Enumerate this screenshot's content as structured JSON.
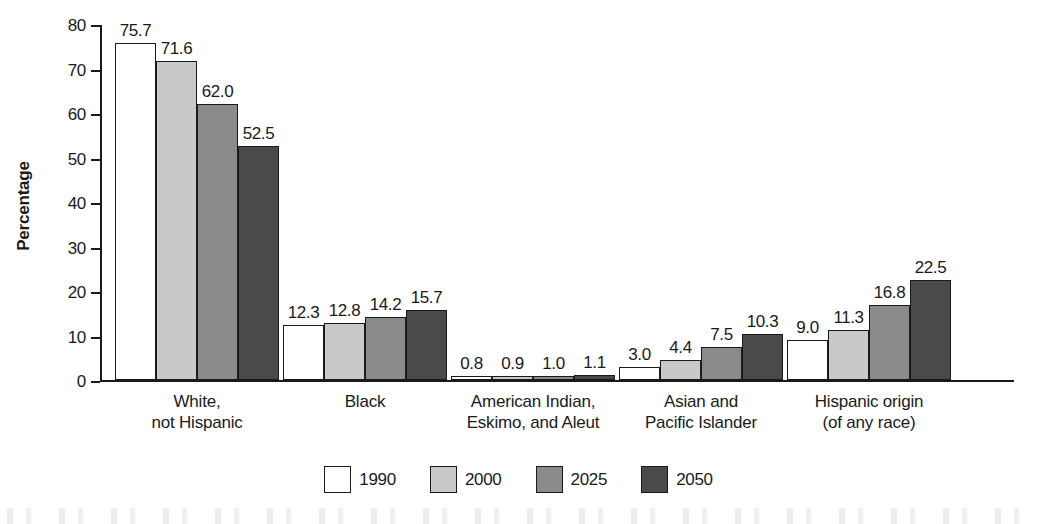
{
  "chart_data": {
    "type": "bar",
    "title": "",
    "xlabel": "",
    "ylabel": "Percentage",
    "ylim": [
      0,
      80
    ],
    "yticks": [
      0,
      10,
      20,
      30,
      40,
      50,
      60,
      70,
      80
    ],
    "ytick_labels": [
      "0",
      "10",
      "20",
      "30",
      "40",
      "50",
      "60",
      "70",
      "80"
    ],
    "grid": false,
    "legend_position": "bottom-center",
    "categories": [
      "White,\nnot Hispanic",
      "Black",
      "American Indian,\nEskimo, and Aleut",
      "Asian and\nPacific Islander",
      "Hispanic origin\n(of any race)"
    ],
    "category_lines": [
      [
        "White,",
        "not Hispanic"
      ],
      [
        "Black",
        ""
      ],
      [
        "American Indian,",
        "Eskimo, and Aleut"
      ],
      [
        "Asian and",
        "Pacific Islander"
      ],
      [
        "Hispanic origin",
        "(of any race)"
      ]
    ],
    "series": [
      {
        "name": "1990",
        "color": "#ffffff",
        "values": [
          75.7,
          12.3,
          0.8,
          3.0,
          9.0
        ],
        "labels": [
          "75.7",
          "12.3",
          "0.8",
          "3.0",
          "9.0"
        ]
      },
      {
        "name": "2000",
        "color": "#c9c9c9",
        "values": [
          71.6,
          12.8,
          0.9,
          4.4,
          11.3
        ],
        "labels": [
          "71.6",
          "12.8",
          "0.9",
          "4.4",
          "11.3"
        ]
      },
      {
        "name": "2025",
        "color": "#8a8a8a",
        "values": [
          62.0,
          14.2,
          1.0,
          7.5,
          16.8
        ],
        "labels": [
          "62.0",
          "14.2",
          "1.0",
          "7.5",
          "16.8"
        ]
      },
      {
        "name": "2050",
        "color": "#4a4a4a",
        "values": [
          52.5,
          15.7,
          1.1,
          10.3,
          22.5
        ],
        "labels": [
          "52.5",
          "15.7",
          "1.1",
          "10.3",
          "22.5"
        ]
      }
    ]
  },
  "legend": {
    "items": [
      {
        "label": "1990",
        "color": "#ffffff"
      },
      {
        "label": "2000",
        "color": "#c9c9c9"
      },
      {
        "label": "2025",
        "color": "#8a8a8a"
      },
      {
        "label": "2050",
        "color": "#4a4a4a"
      }
    ]
  },
  "axis": {
    "y_title": "Percentage"
  }
}
